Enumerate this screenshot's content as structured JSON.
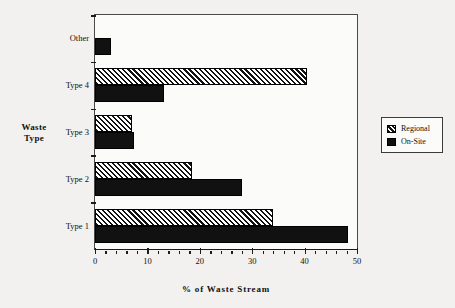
{
  "chart_data": {
    "type": "bar",
    "orientation": "horizontal",
    "title": "",
    "xlabel": "% of Waste Stream",
    "ylabel": "Waste Type",
    "categories": [
      "Type 1",
      "Type 2",
      "Type 3",
      "Type 4",
      "Other"
    ],
    "series": [
      {
        "name": "Regional",
        "values": [
          34,
          18.5,
          7,
          40.5,
          0
        ],
        "style": "hatched"
      },
      {
        "name": "On-Site",
        "values": [
          48.2,
          28,
          7.5,
          13.2,
          3
        ],
        "style": "solid"
      }
    ],
    "xlim": [
      0,
      50
    ],
    "xticks": [
      0,
      10,
      20,
      30,
      40,
      50
    ],
    "xtick_labels": [
      "0",
      "10",
      "20",
      "30",
      "40",
      "50"
    ],
    "xminor_step": 2,
    "grid": false,
    "legend_position": "right",
    "legend_entries": [
      "Regional",
      "On-Site"
    ]
  },
  "legend": {
    "items": [
      {
        "label": "Regional",
        "swatch": "hatched-swatch"
      },
      {
        "label": "On-Site",
        "swatch": "solid-swatch"
      }
    ]
  },
  "colors": {
    "background": "#f2f1ef",
    "plot_background": "#fbfbfa",
    "axis": "#1b1b1b",
    "bar_solid": "#111111",
    "bar_hatch_line": "#121212",
    "text": "#111111"
  }
}
